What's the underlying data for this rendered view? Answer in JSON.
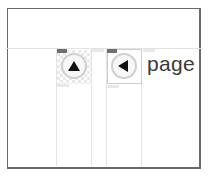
{
  "page_indicator": {
    "label": "page 1"
  },
  "buttons": {
    "up": {
      "icon": "up-triangle-icon"
    },
    "previous": {
      "icon": "left-triangle-icon"
    }
  },
  "colors": {
    "frame_border": "#6a6a6a",
    "gridline": "#e4e4e4",
    "button_border": "#cfcfcf",
    "icon": "#111111",
    "text": "#3a3a3a"
  }
}
